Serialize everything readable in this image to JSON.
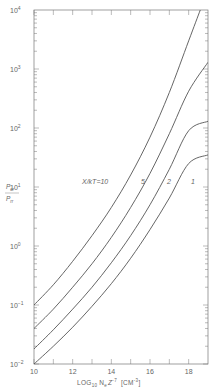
{
  "chart_data": {
    "type": "line",
    "title": "",
    "xlabel": "LOG10 Ne Z^-7 [CM^-3]",
    "ylabel": "Pcr / Prr",
    "x_range": [
      10,
      19
    ],
    "y_scale": "log",
    "ylim": [
      0.01,
      10000
    ],
    "x_ticks": [
      10,
      11,
      12,
      13,
      14,
      15,
      16,
      17,
      18
    ],
    "x_tick_labels": [
      "10",
      "12",
      "14",
      "16",
      "18"
    ],
    "y_tick_labels": [
      "10^-2",
      "10^-1",
      "10^0",
      "10^1",
      "10^2",
      "10^3",
      "10^4"
    ],
    "grid": false,
    "legend": "inline curve labels",
    "curve_label_prefix": "X/kT = ",
    "series": [
      {
        "name": "10",
        "x": [
          10,
          11,
          12,
          13,
          14,
          15,
          16,
          17,
          18,
          18.6
        ],
        "y": [
          0.1,
          0.22,
          0.55,
          1.5,
          4.5,
          16,
          70,
          400,
          3000,
          10000
        ]
      },
      {
        "name": "5",
        "x": [
          10,
          11,
          12,
          13,
          14,
          15,
          16,
          17,
          18,
          19
        ],
        "y": [
          0.04,
          0.085,
          0.2,
          0.5,
          1.4,
          4.5,
          17,
          80,
          420,
          1300
        ]
      },
      {
        "name": "2",
        "x": [
          10,
          11,
          12,
          13,
          14,
          15,
          16,
          17,
          18,
          19
        ],
        "y": [
          0.018,
          0.038,
          0.085,
          0.2,
          0.52,
          1.5,
          5,
          20,
          90,
          130
        ]
      },
      {
        "name": "1",
        "x": [
          10,
          11,
          12,
          13,
          14,
          15,
          16,
          17,
          18,
          19
        ],
        "y": [
          0.01,
          0.02,
          0.042,
          0.095,
          0.23,
          0.62,
          1.9,
          6.5,
          25,
          35
        ]
      }
    ]
  },
  "labels": {
    "ylabel_num": "P",
    "ylabel_num_sub": "cr",
    "ylabel_den": "P",
    "ylabel_den_sub": "rr",
    "xlabel_log": "LOG",
    "xlabel_log_sub": "10",
    "xlabel_ne": "N",
    "xlabel_ne_sub": "e",
    "xlabel_z": "Z",
    "xlabel_z_sup": "-7",
    "xlabel_unit": "[CM",
    "xlabel_unit_sup": "-3",
    "xlabel_unit_close": "]",
    "curve_prefix": "X/kT=10",
    "curve_5": "5",
    "curve_2": "2",
    "curve_1": "1"
  }
}
